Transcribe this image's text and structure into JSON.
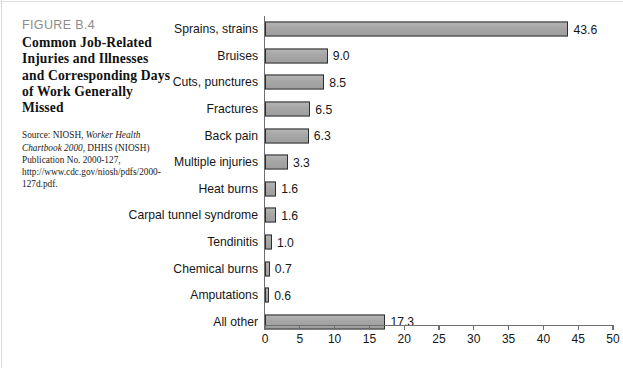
{
  "figure": {
    "number": "FIGURE B.4",
    "title": "Common Job-Related Injuries and Illnesses and Corresponding Days of Work Generally Missed",
    "source_prefix": "Source: NIOSH, ",
    "source_italic": "Worker Health Chartbook 2000",
    "source_rest": ", DHHS (NIOSH) Publication No. 2000-127, http://www.cdc.gov/niosh/pdfs/2000-127d.pdf."
  },
  "colors": {
    "bar_fill": "#a8a8a8",
    "bar_border": "#2e2e2e",
    "axis": "#6f6f6f",
    "figure_number": "#8c8c8c",
    "text": "#161616"
  },
  "chart_data": {
    "type": "bar",
    "orientation": "horizontal",
    "title": "Common Job-Related Injuries and Illnesses and Corresponding Days of Work Generally Missed",
    "xlabel": "",
    "ylabel": "",
    "xlim": [
      0,
      50
    ],
    "xticks": [
      0,
      5,
      10,
      15,
      20,
      25,
      30,
      35,
      40,
      45,
      50
    ],
    "xtick_labels": [
      "0",
      "5",
      "10",
      "15",
      "20",
      "25",
      "30",
      "35",
      "40",
      "45",
      "50"
    ],
    "grid": false,
    "legend": null,
    "categories": [
      "Sprains, strains",
      "Bruises",
      "Cuts, punctures",
      "Fractures",
      "Back pain",
      "Multiple injuries",
      "Heat burns",
      "Carpal tunnel syndrome",
      "Tendinitis",
      "Chemical burns",
      "Amputations",
      "All other"
    ],
    "values": [
      43.6,
      9.0,
      8.5,
      6.5,
      6.3,
      3.3,
      1.6,
      1.6,
      1.0,
      0.7,
      0.6,
      17.3
    ],
    "value_labels": [
      "43.6",
      "9.0",
      "8.5",
      "6.5",
      "6.3",
      "3.3",
      "1.6",
      "1.6",
      "1.0",
      "0.7",
      "0.6",
      "17.3"
    ]
  }
}
